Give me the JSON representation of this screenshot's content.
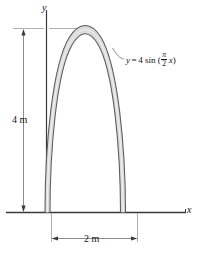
{
  "figure": {
    "background_color": "#ffffff",
    "axes": {
      "y_label": "y",
      "x_label": "x",
      "axis_color": "#333333"
    },
    "dimensions": {
      "vertical": {
        "label": "4 m",
        "value": 4,
        "unit": "m"
      },
      "horizontal": {
        "label": "2 m",
        "value": 2,
        "unit": "m"
      }
    },
    "curve_label": {
      "lhs": "y",
      "equals": "=",
      "amplitude": "4",
      "function": "sin",
      "open_paren": "(",
      "numerator": "π",
      "denominator": "2",
      "variable": "x",
      "close_paren": ")",
      "full_text": "y = 4 sin (π/2 x)"
    },
    "curve": {
      "type": "sine",
      "equation": "y = 4 sin((π/2)x)",
      "amplitude": 4,
      "domain": [
        0,
        2
      ],
      "stroke_color": "#4d4d4d",
      "fill_color": "#d9d9d9"
    }
  }
}
